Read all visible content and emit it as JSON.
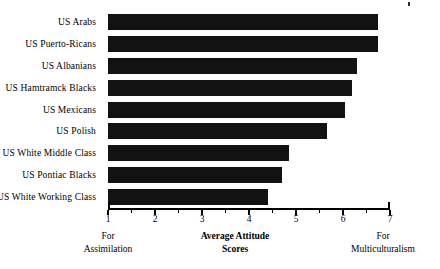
{
  "chart_data": {
    "type": "bar",
    "orientation": "horizontal",
    "title": "",
    "xlabel": "Average Attitude Scores",
    "ylabel": "",
    "xlim": [
      1,
      7
    ],
    "grid": false,
    "legend": null,
    "categories": [
      "US Arabs",
      "US Puerto-Ricans",
      "US Albanians",
      "US Hamtramck Blacks",
      "US Mexicans",
      "US Polish",
      "US White Middle Class",
      "US Pontiac Blacks",
      "US White Working Class"
    ],
    "values": [
      6.75,
      6.75,
      6.3,
      6.2,
      6.05,
      5.65,
      4.85,
      4.7,
      4.4
    ],
    "x_ticks": [
      1,
      2,
      3,
      4,
      5,
      6,
      7
    ],
    "x_tick_labels": [
      "1",
      "2",
      "3",
      "4",
      "5",
      "6",
      "7"
    ],
    "x_minor_ticks": [
      1.5,
      2.5,
      3.5,
      4.5,
      5.5,
      6.5
    ],
    "bar_color": "#121212",
    "axis_color": "#000000",
    "background_color": "#ffffff",
    "annotations": {
      "axis_left_caption": "For\nAssimilation",
      "axis_left_caption_line1": "For",
      "axis_left_caption_line2": "Assimilation",
      "axis_center_caption_line1": "Average Attitude",
      "axis_center_caption_line2": "Scores",
      "axis_right_caption_line1": "For",
      "axis_right_caption_line2": "Multiculturalism"
    }
  }
}
